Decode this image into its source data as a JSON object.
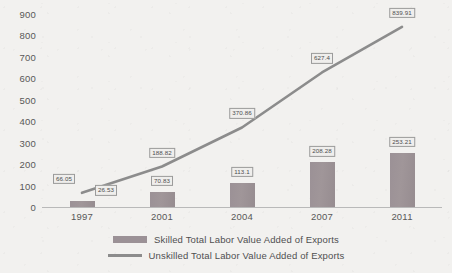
{
  "chart_data": {
    "type": "bar",
    "title": "",
    "subtitle": "",
    "xlabel": "",
    "ylabel": "",
    "categories": [
      "1997",
      "2001",
      "2004",
      "2007",
      "2011"
    ],
    "ylim": [
      0,
      900
    ],
    "yticks": [
      "0",
      "100",
      "200",
      "300",
      "400",
      "500",
      "600",
      "700",
      "800",
      "900"
    ],
    "grid": false,
    "legend_position": "bottom",
    "series": [
      {
        "name": "Skilled Total Labor Value Added of Exports",
        "type": "bar",
        "color": "#9b9196",
        "values": [
          26.53,
          70.83,
          113.1,
          208.28,
          253.21
        ],
        "labels": [
          "26.53",
          "70.83",
          "113.1",
          "208.28",
          "253.21"
        ]
      },
      {
        "name": "Unskilled Total Labor Value Added of Exports",
        "type": "line",
        "color": "#8c8c8c",
        "values": [
          66.05,
          188.82,
          370.86,
          627.4,
          839.91
        ],
        "labels": [
          "66.05",
          "188.82",
          "370.86",
          "627.4",
          "839.91"
        ]
      }
    ]
  },
  "legend": {
    "items": [
      {
        "label": "Skilled Total Labor Value Added of Exports"
      },
      {
        "label": "Unskilled Total Labor Value Added of Exports"
      }
    ]
  }
}
